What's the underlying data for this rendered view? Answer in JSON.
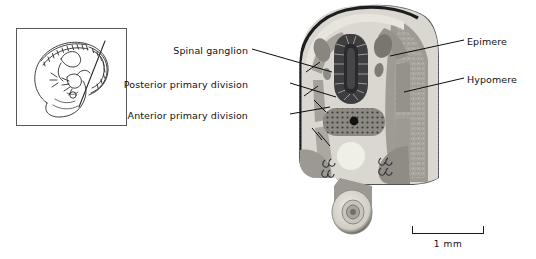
{
  "figure": {
    "type": "histological-section-diagram"
  },
  "inset": {
    "name": "embryo-whole-mount-drawing",
    "description": "Line drawing of a curled embryo with somites and a section plane line"
  },
  "labels": {
    "left": [
      {
        "id": "spinal-ganglion",
        "text": "Spinal ganglion"
      },
      {
        "id": "posterior-primary-division",
        "text": "Posterior primary division"
      },
      {
        "id": "anterior-primary-division",
        "text": "Anterior primary division"
      }
    ],
    "right": [
      {
        "id": "epimere",
        "text": "Epimere"
      },
      {
        "id": "hypomere",
        "text": "Hypomere"
      }
    ]
  },
  "scale_bar": {
    "label": "1 mm",
    "length_px": 72
  },
  "colors": {
    "background": "#ffffff",
    "outline": "#1a1a1a",
    "ectoderm_dark": "#4a4a4c",
    "mesenchyme_light": "#d8d6cf",
    "mesenchyme_mid": "#b9b7ae",
    "somite_gray": "#9a9890",
    "neural_tube_dark": "#3c3c3e",
    "lumen_light": "#efeee8",
    "label_text": "#111111",
    "inset_border": "#58585a"
  },
  "structures": [
    {
      "id": "neural-tube",
      "name": "Neural tube / spinal cord"
    },
    {
      "id": "spinal-ganglion-l",
      "name": "Spinal ganglion (left)"
    },
    {
      "id": "spinal-ganglion-r",
      "name": "Spinal ganglion (right)"
    },
    {
      "id": "notochord-aorta",
      "name": "Dorsal aorta region"
    },
    {
      "id": "coelom",
      "name": "Coelomic cavity"
    },
    {
      "id": "gut-tube",
      "name": "Gut tube"
    },
    {
      "id": "epimere-region",
      "name": "Epimere (dorsal somite region)"
    },
    {
      "id": "hypomere-region",
      "name": "Hypomere (lateral plate region)"
    }
  ]
}
